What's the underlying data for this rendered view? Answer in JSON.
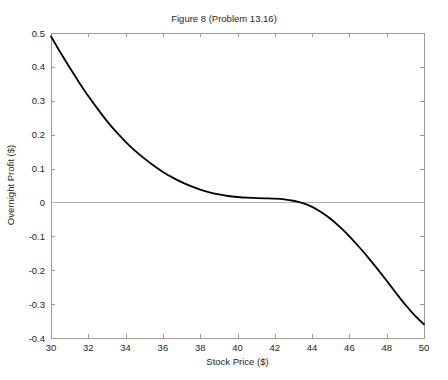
{
  "chart_data": {
    "type": "line",
    "title": "Figure 8 (Problem 13.16)",
    "xlabel": "Stock Price ($)",
    "ylabel": "Overnight Profit ($)",
    "xlim": [
      30,
      50
    ],
    "ylim": [
      -0.4,
      0.5
    ],
    "grid": false,
    "legend": null,
    "xticks": [
      30,
      32,
      34,
      36,
      38,
      40,
      42,
      44,
      46,
      48,
      50
    ],
    "xtick_labels": [
      "30",
      "32",
      "34",
      "36",
      "38",
      "40",
      "42",
      "44",
      "46",
      "48",
      "50"
    ],
    "yticks": [
      -0.4,
      -0.3,
      -0.2,
      -0.1,
      0,
      0.1,
      0.2,
      0.3,
      0.4,
      0.5
    ],
    "ytick_labels": [
      "-0.4",
      "-0.3",
      "-0.2",
      "-0.1",
      "0",
      "0.1",
      "0.2",
      "0.3",
      "0.4",
      "0.5"
    ],
    "zero_line": 0,
    "line_color": "#000000",
    "line_width": 1.8,
    "axis_color": "#9a9a9a",
    "series": [
      {
        "name": "Overnight Profit",
        "x": [
          30.0,
          30.5,
          31.0,
          31.5,
          32.0,
          32.5,
          33.0,
          33.5,
          34.0,
          34.5,
          35.0,
          35.5,
          36.0,
          36.5,
          37.0,
          37.5,
          38.0,
          38.5,
          39.0,
          39.5,
          40.0,
          40.5,
          41.0,
          41.5,
          42.0,
          42.5,
          43.0,
          43.5,
          44.0,
          44.5,
          45.0,
          45.5,
          46.0,
          46.5,
          47.0,
          47.5,
          48.0,
          48.5,
          49.0,
          49.5,
          50.0
        ],
        "y": [
          0.49,
          0.443,
          0.398,
          0.355,
          0.314,
          0.276,
          0.24,
          0.208,
          0.179,
          0.153,
          0.13,
          0.109,
          0.09,
          0.074,
          0.06,
          0.048,
          0.038,
          0.03,
          0.024,
          0.019,
          0.016,
          0.014,
          0.013,
          0.012,
          0.011,
          0.009,
          0.005,
          -0.002,
          -0.013,
          -0.029,
          -0.049,
          -0.073,
          -0.1,
          -0.13,
          -0.162,
          -0.196,
          -0.231,
          -0.267,
          -0.302,
          -0.333,
          -0.36
        ]
      }
    ]
  },
  "layout": {
    "plot_left": 51,
    "plot_right": 424,
    "plot_top": 33,
    "plot_bottom": 338
  }
}
